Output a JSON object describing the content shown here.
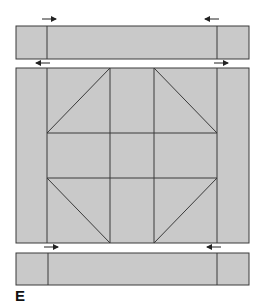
{
  "figure": {
    "label": "E",
    "fill_color": "#c9c9c9",
    "stroke_color": "#3a3a3a",
    "arrow_color": "#222222"
  },
  "top_strip": {
    "x": 16,
    "y": 26,
    "width": 233,
    "height": 33,
    "dividers_x": [
      47,
      217
    ],
    "arrows": [
      {
        "x1": 42,
        "x2": 56,
        "y": 19,
        "direction": "right"
      },
      {
        "x1": 219,
        "x2": 205,
        "y": 19,
        "direction": "left"
      }
    ]
  },
  "middle_block": {
    "x": 16,
    "y": 68,
    "width": 233,
    "height": 175,
    "verticals_x": [
      47,
      110,
      154,
      217
    ],
    "horizontals_y": [
      133,
      178
    ],
    "arrows_above": [
      {
        "x1": 50,
        "x2": 36,
        "y": 63,
        "direction": "left"
      },
      {
        "x1": 214,
        "x2": 228,
        "y": 63,
        "direction": "right"
      }
    ]
  },
  "bottom_strip": {
    "x": 16,
    "y": 253,
    "width": 233,
    "height": 32,
    "dividers_x": [
      48,
      217
    ],
    "arrows": [
      {
        "x1": 44,
        "x2": 58,
        "y": 247,
        "direction": "right"
      },
      {
        "x1": 221,
        "x2": 207,
        "y": 247,
        "direction": "left"
      }
    ]
  }
}
